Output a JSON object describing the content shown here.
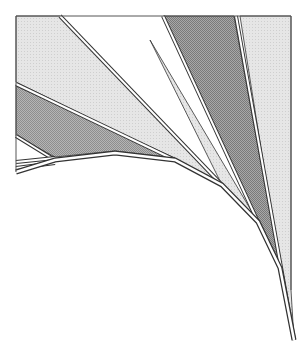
{
  "canvas": {
    "width": 307,
    "height": 349,
    "background": "#ffffff"
  },
  "colors": {
    "frame": "#555555",
    "stroke": "#333333",
    "band_light": "#e6e6e6",
    "band_light_dot": "#cfcfcf",
    "band_mid": "#b5b5b5",
    "band_mid_dot": "#8e8e8e",
    "band_dark": "#a8a8a8",
    "band_dark_dot": "#7a7a7a",
    "edge_highlight": "#ffffff"
  },
  "frame": {
    "top": {
      "x1": 16,
      "y1": 16,
      "x2": 291,
      "y2": 16
    },
    "left": {
      "x1": 16,
      "y1": 16,
      "x2": 16,
      "y2": 172
    },
    "right": {
      "x1": 291,
      "y1": 16,
      "x2": 291,
      "y2": 290
    }
  },
  "spine": {
    "label": "curved-spine",
    "points": [
      [
        16,
        172
      ],
      [
        55,
        160
      ],
      [
        115,
        153
      ],
      [
        175,
        160
      ],
      [
        222,
        185
      ],
      [
        258,
        222
      ],
      [
        280,
        268
      ],
      [
        294,
        340
      ]
    ]
  },
  "bands": [
    {
      "id": "light-wedge-left",
      "fill": "light",
      "polygon": [
        [
          16,
          16
        ],
        [
          60,
          16
        ],
        [
          222,
          185
        ],
        [
          175,
          160
        ],
        [
          16,
          82
        ]
      ]
    },
    {
      "id": "mid-wedge-left",
      "fill": "mid",
      "polygon": [
        [
          16,
          86
        ],
        [
          175,
          158
        ],
        [
          115,
          151
        ],
        [
          55,
          157
        ],
        [
          16,
          136
        ]
      ]
    },
    {
      "id": "light-wedge-center",
      "fill": "light",
      "polygon": [
        [
          150,
          40
        ],
        [
          258,
          222
        ],
        [
          222,
          185
        ]
      ]
    },
    {
      "id": "dark-wedge-right",
      "fill": "dark",
      "polygon": [
        [
          163,
          16
        ],
        [
          234,
          16
        ],
        [
          280,
          268
        ],
        [
          258,
          222
        ]
      ]
    },
    {
      "id": "light-wedge-right",
      "fill": "light",
      "polygon": [
        [
          240,
          16
        ],
        [
          291,
          16
        ],
        [
          291,
          290
        ],
        [
          294,
          340
        ],
        [
          280,
          268
        ]
      ]
    }
  ],
  "ridges": [
    {
      "id": "ridge-a",
      "points": [
        [
          60,
          16
        ],
        [
          222,
          185
        ]
      ]
    },
    {
      "id": "ridge-b",
      "points": [
        [
          16,
          84
        ],
        [
          175,
          160
        ]
      ]
    },
    {
      "id": "ridge-c",
      "points": [
        [
          16,
          136
        ],
        [
          55,
          160
        ]
      ]
    },
    {
      "id": "ridge-d",
      "points": [
        [
          163,
          16
        ],
        [
          258,
          222
        ]
      ]
    },
    {
      "id": "ridge-e",
      "points": [
        [
          236,
          16
        ],
        [
          294,
          340
        ]
      ]
    },
    {
      "id": "ridge-f",
      "points": [
        [
          16,
          162
        ],
        [
          55,
          158
        ]
      ]
    },
    {
      "id": "ridge-g",
      "points": [
        [
          16,
          168
        ],
        [
          55,
          163
        ]
      ]
    }
  ]
}
